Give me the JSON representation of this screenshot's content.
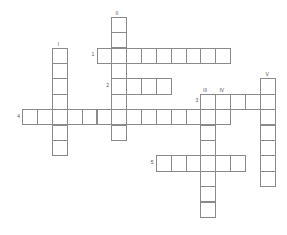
{
  "puzzle": {
    "type": "crossword",
    "grid": {
      "origin_x": 22.3,
      "origin_y": 16.7,
      "cell_w": 14.84,
      "cell_h": 15.4
    },
    "colors": {
      "border": "#8a8a8a",
      "cell_bg": "#ffffff",
      "label": "#555555"
    },
    "across": [
      {
        "number": "1",
        "row": 2,
        "col": 5,
        "length": 9
      },
      {
        "number": "2",
        "row": 4,
        "col": 6,
        "length": 4
      },
      {
        "number": "3",
        "row": 5,
        "col": 12,
        "length": 5
      },
      {
        "number": "4",
        "row": 6,
        "col": 0,
        "length": 14
      },
      {
        "number": "5",
        "row": 9,
        "col": 9,
        "length": 6
      }
    ],
    "down": [
      {
        "number": "I",
        "row": 2,
        "col": 2,
        "length": 7
      },
      {
        "number": "II",
        "row": 0,
        "col": 6,
        "length": 8
      },
      {
        "number": "III",
        "row": 5,
        "col": 12,
        "length": 8
      },
      {
        "number": "IV",
        "row": 5,
        "col": 13,
        "length": 2
      },
      {
        "number": "V",
        "row": 4,
        "col": 16,
        "length": 7
      }
    ]
  }
}
